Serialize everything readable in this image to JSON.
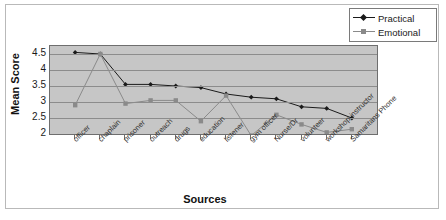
{
  "chart_data": {
    "type": "line",
    "title": "",
    "xlabel": "Sources",
    "ylabel": "Mean Score",
    "ylim": [
      2,
      4.75
    ],
    "yticks": [
      2,
      2.5,
      3,
      3.5,
      4,
      4.5
    ],
    "ytick_labels": [
      "2",
      "2.5",
      "3",
      "3.5",
      "4",
      "4.5"
    ],
    "grid": true,
    "legend_position": "top-right",
    "plot_background": "#c6c6c6",
    "categories": [
      "officer",
      "chaplain",
      "prisoner",
      "outreach",
      "drugs",
      "education",
      "listener",
      "gym officer",
      "Nurse/Dr",
      "volunteer",
      "workshop instructor",
      "Samaritans Phone"
    ],
    "series": [
      {
        "name": "Practical",
        "color": "#1a1a1a",
        "marker": "diamond",
        "values": [
          4.55,
          4.5,
          3.55,
          3.55,
          3.5,
          3.45,
          3.25,
          3.15,
          3.1,
          2.85,
          2.8,
          2.5
        ]
      },
      {
        "name": "Emotional",
        "color": "#8a8a8a",
        "marker": "square",
        "values": [
          2.9,
          4.5,
          2.95,
          3.05,
          3.05,
          2.4,
          3.2,
          1.95,
          2.6,
          2.3,
          2.05,
          2.15
        ]
      }
    ]
  },
  "legend": {
    "items": [
      {
        "label": "Practical"
      },
      {
        "label": "Emotional"
      }
    ]
  },
  "axis_titles": {
    "y": "Mean Score",
    "x": "Sources"
  }
}
